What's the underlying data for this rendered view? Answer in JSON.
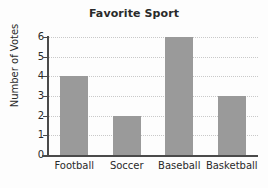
{
  "chart_data": {
    "type": "bar",
    "title": "Favorite Sport",
    "xlabel": "",
    "ylabel": "Number of Votes",
    "categories": [
      "Football",
      "Soccer",
      "Baseball",
      "Basketball"
    ],
    "values": [
      4,
      2,
      6,
      3
    ],
    "ylim": [
      0,
      6
    ],
    "yticks": [
      0,
      1,
      2,
      3,
      4,
      5,
      6
    ],
    "ytick_labels": [
      "0",
      "1",
      "2",
      "3",
      "4",
      "5",
      "6"
    ],
    "grid": "horizontal-dotted",
    "legend": "none",
    "bar_color": "#9a9a9a",
    "axis_color": "#4a4a4a",
    "grid_color": "#c9c9c9",
    "background_color": "#fdfdfd",
    "text_color": "#2a2a2a"
  }
}
